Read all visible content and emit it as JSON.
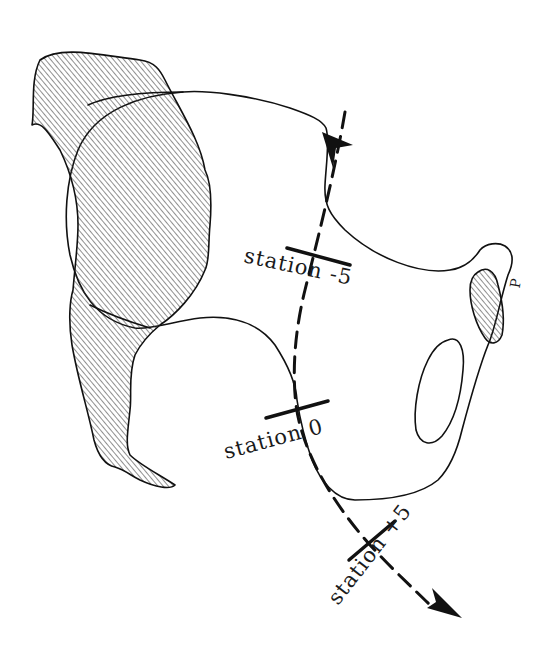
{
  "diagram": {
    "title": "",
    "stations": [
      {
        "id": "minus5",
        "label": "station -5"
      },
      {
        "id": "zero",
        "label": "station 0"
      },
      {
        "id": "plus5",
        "label": "station +5"
      }
    ],
    "symphysis_label": "P",
    "colors": {
      "line": "#111111",
      "background": "#ffffff"
    }
  }
}
